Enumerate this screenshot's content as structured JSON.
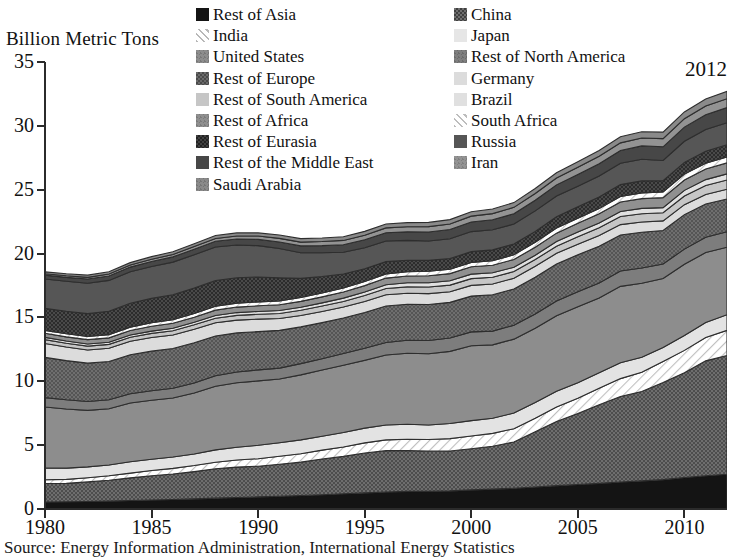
{
  "axis_title": "Billion Metric Tons",
  "annotation": "2012",
  "source": "Source: Energy Information Administration, International Energy Statistics",
  "legend": {
    "column_left": [
      {
        "label": "Rest of Asia",
        "swatch": "black-solid"
      },
      {
        "label": "India",
        "swatch": "light-hatch"
      },
      {
        "label": "United States",
        "swatch": "mid-gray"
      },
      {
        "label": "Rest of Europe",
        "swatch": "dark-texture"
      },
      {
        "label": "Rest of South America",
        "swatch": "light-gray"
      },
      {
        "label": "Rest of Africa",
        "swatch": "mid-gray-2"
      },
      {
        "label": "Rest of Eurasia",
        "swatch": "darkest-texture"
      },
      {
        "label": "Rest of the Middle East",
        "swatch": "dark-gray"
      },
      {
        "label": "Saudi Arabia",
        "swatch": "mid-gray-3"
      }
    ],
    "column_right": [
      {
        "label": "China",
        "swatch": "dark-checker"
      },
      {
        "label": "Japan",
        "swatch": "very-light"
      },
      {
        "label": "Rest of North America",
        "swatch": "mid-gray-4"
      },
      {
        "label": "Germany",
        "swatch": "pale-gray"
      },
      {
        "label": "Brazil",
        "swatch": "pale-gray-2"
      },
      {
        "label": "South Africa",
        "swatch": "light-hatch-2"
      },
      {
        "label": "Russia",
        "swatch": "dark-gray-2"
      },
      {
        "label": "Iran",
        "swatch": "mid-gray-5"
      }
    ]
  },
  "chart_data": {
    "type": "area",
    "stacked": true,
    "title": "",
    "xlabel": "",
    "ylabel": "Billion Metric Tons",
    "xlim": [
      1980,
      2012
    ],
    "ylim": [
      0,
      35
    ],
    "ytick_values": [
      0,
      5,
      10,
      15,
      20,
      25,
      30,
      35
    ],
    "xtick_values": [
      1980,
      1985,
      1990,
      1995,
      2000,
      2005,
      2010
    ],
    "grid": false,
    "legend_position": "top",
    "x": [
      1980,
      1981,
      1982,
      1983,
      1984,
      1985,
      1986,
      1987,
      1988,
      1989,
      1990,
      1991,
      1992,
      1993,
      1994,
      1995,
      1996,
      1997,
      1998,
      1999,
      2000,
      2001,
      2002,
      2003,
      2004,
      2005,
      2006,
      2007,
      2008,
      2009,
      2010,
      2011,
      2012
    ],
    "series": [
      {
        "name": "Rest of Asia",
        "values": [
          0.55,
          0.57,
          0.59,
          0.62,
          0.66,
          0.7,
          0.74,
          0.79,
          0.85,
          0.9,
          0.95,
          1.0,
          1.06,
          1.12,
          1.19,
          1.26,
          1.33,
          1.38,
          1.38,
          1.42,
          1.5,
          1.56,
          1.63,
          1.72,
          1.83,
          1.92,
          2.01,
          2.11,
          2.2,
          2.3,
          2.47,
          2.6,
          2.72
        ]
      },
      {
        "name": "China",
        "values": [
          1.45,
          1.44,
          1.53,
          1.63,
          1.78,
          1.9,
          2.0,
          2.14,
          2.3,
          2.38,
          2.4,
          2.5,
          2.61,
          2.8,
          2.93,
          3.13,
          3.24,
          3.2,
          3.15,
          3.12,
          3.22,
          3.35,
          3.62,
          4.32,
          5.02,
          5.55,
          6.15,
          6.7,
          7.0,
          7.6,
          8.2,
          9.0,
          9.3
        ]
      },
      {
        "name": "India",
        "values": [
          0.29,
          0.31,
          0.33,
          0.35,
          0.37,
          0.41,
          0.44,
          0.47,
          0.51,
          0.56,
          0.59,
          0.63,
          0.66,
          0.69,
          0.73,
          0.79,
          0.84,
          0.88,
          0.91,
          0.97,
          1.0,
          1.01,
          1.04,
          1.07,
          1.14,
          1.2,
          1.29,
          1.4,
          1.5,
          1.65,
          1.75,
          1.83,
          1.97
        ]
      },
      {
        "name": "Japan",
        "values": [
          0.92,
          0.88,
          0.85,
          0.84,
          0.89,
          0.88,
          0.89,
          0.9,
          0.97,
          1.0,
          1.05,
          1.06,
          1.08,
          1.08,
          1.14,
          1.15,
          1.17,
          1.18,
          1.14,
          1.18,
          1.2,
          1.18,
          1.22,
          1.22,
          1.23,
          1.22,
          1.21,
          1.24,
          1.18,
          1.1,
          1.16,
          1.18,
          1.22
        ]
      },
      {
        "name": "United States",
        "values": [
          4.78,
          4.63,
          4.42,
          4.41,
          4.6,
          4.62,
          4.62,
          4.78,
          4.98,
          5.04,
          5.04,
          4.99,
          5.09,
          5.19,
          5.26,
          5.31,
          5.48,
          5.56,
          5.58,
          5.65,
          5.86,
          5.75,
          5.79,
          5.82,
          5.91,
          5.95,
          5.87,
          5.98,
          5.8,
          5.4,
          5.59,
          5.47,
          5.29
        ]
      },
      {
        "name": "Rest of North America",
        "values": [
          0.73,
          0.72,
          0.7,
          0.7,
          0.73,
          0.75,
          0.76,
          0.78,
          0.82,
          0.85,
          0.86,
          0.85,
          0.88,
          0.89,
          0.92,
          0.95,
          0.98,
          1.01,
          1.03,
          1.05,
          1.09,
          1.08,
          1.09,
          1.12,
          1.15,
          1.17,
          1.17,
          1.2,
          1.19,
          1.14,
          1.18,
          1.2,
          1.21
        ]
      },
      {
        "name": "Rest of Europe",
        "values": [
          3.15,
          3.07,
          3.0,
          3.0,
          3.05,
          3.1,
          3.12,
          3.16,
          3.12,
          3.06,
          3.0,
          2.96,
          2.88,
          2.82,
          2.78,
          2.8,
          2.86,
          2.82,
          2.82,
          2.79,
          2.8,
          2.84,
          2.84,
          2.88,
          2.9,
          2.89,
          2.88,
          2.83,
          2.8,
          2.62,
          2.7,
          2.6,
          2.57
        ]
      },
      {
        "name": "Germany",
        "values": [
          1.09,
          1.06,
          1.03,
          1.04,
          1.06,
          1.07,
          1.06,
          1.05,
          1.03,
          1.0,
          0.98,
          0.93,
          0.89,
          0.88,
          0.86,
          0.86,
          0.88,
          0.86,
          0.85,
          0.83,
          0.84,
          0.85,
          0.84,
          0.85,
          0.84,
          0.83,
          0.84,
          0.81,
          0.8,
          0.75,
          0.78,
          0.75,
          0.76
        ]
      },
      {
        "name": "Rest of South America",
        "values": [
          0.3,
          0.3,
          0.3,
          0.3,
          0.31,
          0.32,
          0.33,
          0.35,
          0.36,
          0.37,
          0.38,
          0.39,
          0.41,
          0.42,
          0.44,
          0.46,
          0.48,
          0.5,
          0.52,
          0.52,
          0.53,
          0.53,
          0.52,
          0.53,
          0.56,
          0.58,
          0.6,
          0.63,
          0.65,
          0.64,
          0.68,
          0.7,
          0.72
        ]
      },
      {
        "name": "Brazil",
        "values": [
          0.18,
          0.17,
          0.17,
          0.16,
          0.17,
          0.18,
          0.19,
          0.2,
          0.21,
          0.22,
          0.22,
          0.23,
          0.24,
          0.25,
          0.26,
          0.28,
          0.3,
          0.32,
          0.33,
          0.34,
          0.35,
          0.35,
          0.34,
          0.34,
          0.36,
          0.37,
          0.38,
          0.4,
          0.42,
          0.4,
          0.44,
          0.46,
          0.48
        ]
      },
      {
        "name": "Rest of Africa",
        "values": [
          0.32,
          0.33,
          0.34,
          0.35,
          0.36,
          0.38,
          0.39,
          0.4,
          0.42,
          0.43,
          0.44,
          0.45,
          0.46,
          0.47,
          0.48,
          0.5,
          0.52,
          0.53,
          0.55,
          0.56,
          0.58,
          0.59,
          0.61,
          0.63,
          0.66,
          0.69,
          0.71,
          0.74,
          0.76,
          0.78,
          0.81,
          0.83,
          0.86
        ]
      },
      {
        "name": "South Africa",
        "values": [
          0.23,
          0.24,
          0.25,
          0.25,
          0.26,
          0.27,
          0.28,
          0.29,
          0.3,
          0.31,
          0.31,
          0.31,
          0.3,
          0.3,
          0.31,
          0.32,
          0.33,
          0.34,
          0.35,
          0.34,
          0.34,
          0.35,
          0.36,
          0.38,
          0.4,
          0.4,
          0.41,
          0.43,
          0.45,
          0.45,
          0.46,
          0.46,
          0.47
        ]
      },
      {
        "name": "Rest of Eurasia",
        "values": [
          1.72,
          1.76,
          1.79,
          1.83,
          1.87,
          1.91,
          1.96,
          2.0,
          2.02,
          1.99,
          1.95,
          1.8,
          1.5,
          1.3,
          1.1,
          1.0,
          0.96,
          0.9,
          0.86,
          0.84,
          0.84,
          0.85,
          0.85,
          0.86,
          0.88,
          0.89,
          0.91,
          0.93,
          0.94,
          0.88,
          0.92,
          0.94,
          0.95
        ]
      },
      {
        "name": "Russia",
        "values": [
          2.3,
          2.35,
          2.38,
          2.42,
          2.46,
          2.5,
          2.55,
          2.6,
          2.62,
          2.56,
          2.45,
          2.3,
          2.0,
          1.85,
          1.7,
          1.65,
          1.62,
          1.55,
          1.52,
          1.55,
          1.57,
          1.58,
          1.56,
          1.6,
          1.62,
          1.62,
          1.65,
          1.67,
          1.7,
          1.58,
          1.65,
          1.7,
          1.72
        ]
      },
      {
        "name": "Rest of the Middle East",
        "values": [
          0.3,
          0.31,
          0.33,
          0.35,
          0.37,
          0.39,
          0.41,
          0.43,
          0.45,
          0.47,
          0.49,
          0.51,
          0.54,
          0.56,
          0.59,
          0.62,
          0.64,
          0.67,
          0.7,
          0.72,
          0.75,
          0.78,
          0.81,
          0.84,
          0.88,
          0.92,
          0.96,
          1.0,
          1.04,
          1.07,
          1.11,
          1.15,
          1.19
        ]
      },
      {
        "name": "Iran",
        "values": [
          0.11,
          0.12,
          0.13,
          0.15,
          0.16,
          0.18,
          0.19,
          0.21,
          0.22,
          0.24,
          0.26,
          0.28,
          0.3,
          0.32,
          0.34,
          0.36,
          0.38,
          0.4,
          0.42,
          0.44,
          0.46,
          0.48,
          0.5,
          0.52,
          0.54,
          0.56,
          0.58,
          0.6,
          0.62,
          0.64,
          0.66,
          0.68,
          0.7
        ]
      },
      {
        "name": "Saudi Arabia",
        "values": [
          0.15,
          0.16,
          0.17,
          0.18,
          0.19,
          0.2,
          0.21,
          0.22,
          0.23,
          0.24,
          0.25,
          0.26,
          0.27,
          0.28,
          0.29,
          0.3,
          0.31,
          0.32,
          0.33,
          0.34,
          0.35,
          0.36,
          0.37,
          0.39,
          0.41,
          0.43,
          0.45,
          0.47,
          0.49,
          0.51,
          0.53,
          0.55,
          0.57
        ]
      }
    ]
  },
  "colors": {
    "black-solid": "#141414",
    "dark-checker": "#5a5a5a",
    "light-hatch": "#d8d8d8",
    "very-light": "#e2e2e2",
    "mid-gray": "#8d8d8d",
    "mid-gray-4": "#7f7f7f",
    "dark-texture": "#5f5f5f",
    "pale-gray": "#dcdcdc",
    "light-gray": "#c9c9c9",
    "pale-gray-2": "#e0e0e0",
    "mid-gray-2": "#909090",
    "light-hatch-2": "#dadada",
    "darkest-texture": "#3a3a3a",
    "dark-gray-2": "#565656",
    "dark-gray": "#4a4a4a",
    "mid-gray-5": "#939393",
    "mid-gray-3": "#8a8a8a",
    "axis": "#2b2b2b"
  }
}
